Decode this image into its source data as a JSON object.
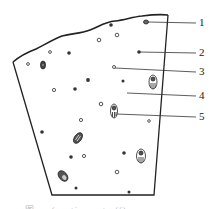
{
  "diagram": {
    "type": "cross-section illustration with numbered callouts",
    "colors": {
      "line": "#222222",
      "background": "#ffffff",
      "caption": "#bbbbbb"
    },
    "callouts": [
      {
        "number": "1",
        "y": 23
      },
      {
        "number": "2",
        "y": 53
      },
      {
        "number": "3",
        "y": 71
      },
      {
        "number": "4",
        "y": 95
      },
      {
        "number": "5",
        "y": 116
      }
    ],
    "caption": "图 … (caption cut off)"
  }
}
